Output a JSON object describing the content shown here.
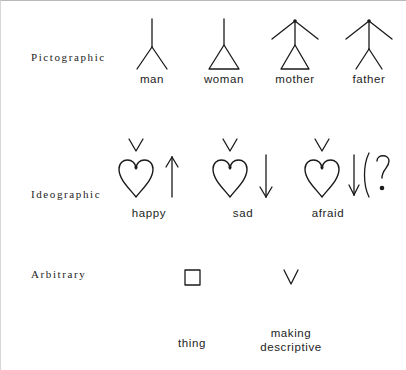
{
  "figure": {
    "background_color": "#ffffff",
    "ink_color": "#1a1a1a",
    "border_color": "#b9b9b9"
  },
  "rows": [
    {
      "id": "pictographic",
      "label": "Pictographic",
      "items": [
        {
          "id": "man",
          "caption": "man",
          "glyph": "stem-with-two-legs"
        },
        {
          "id": "woman",
          "caption": "woman",
          "glyph": "stem-with-triangle"
        },
        {
          "id": "mother",
          "caption": "mother",
          "glyph": "triangle-with-arms"
        },
        {
          "id": "father",
          "caption": "father",
          "glyph": "legs-with-arms"
        }
      ]
    },
    {
      "id": "ideographic",
      "label": "Ideographic",
      "items": [
        {
          "id": "happy",
          "caption": "happy",
          "glyph": "vee-heart-up-arrow",
          "marks": [
            "v",
            "heart",
            "arrow-up"
          ]
        },
        {
          "id": "sad",
          "caption": "sad",
          "glyph": "vee-heart-down-arrow",
          "marks": [
            "v",
            "heart",
            "arrow-down"
          ]
        },
        {
          "id": "afraid",
          "caption": "afraid",
          "glyph": "vee-heart-down-arrow-question",
          "marks": [
            "v",
            "heart",
            "arrow-down",
            "paren",
            "question-mark"
          ]
        }
      ]
    },
    {
      "id": "arbitrary",
      "label": "Arbitrary",
      "items": [
        {
          "id": "thing",
          "caption": "thing",
          "glyph": "square"
        },
        {
          "id": "making-descriptive",
          "caption": "making\ndescriptive",
          "caption_line1": "making",
          "caption_line2": "descriptive",
          "glyph": "vee"
        }
      ]
    }
  ]
}
